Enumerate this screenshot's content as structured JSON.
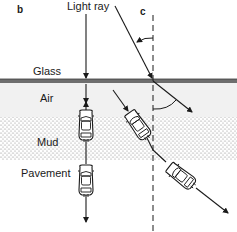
{
  "figure": {
    "panel_b_label": "b",
    "panel_c_label": "c",
    "light_ray_label": "Light ray",
    "layers": {
      "glass": "Glass",
      "air": "Air",
      "mud": "Mud",
      "pavement": "Pavement"
    },
    "colors": {
      "ink": "#1a1a1a",
      "glass_line": "#6e6e6e",
      "air_fill": "#f1f1f1",
      "mud_dot": "#7a7a7a",
      "background": "#ffffff"
    }
  }
}
